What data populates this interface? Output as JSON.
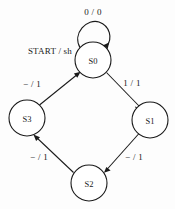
{
  "diagram": {
    "type": "state-transition-diagram",
    "background_color": "#fdfdfd",
    "line_color": "#1a1a1a",
    "start": {
      "label": "START / sh",
      "target_state": "S0"
    },
    "states": [
      {
        "id": "S0",
        "label": "S0",
        "cx": 93,
        "cy": 60,
        "r": 18
      },
      {
        "id": "S1",
        "label": "S1",
        "cx": 150,
        "cy": 120,
        "r": 18
      },
      {
        "id": "S2",
        "label": "S2",
        "cx": 89,
        "cy": 183,
        "r": 18
      },
      {
        "id": "S3",
        "label": "S3",
        "cx": 27,
        "cy": 118,
        "r": 18
      }
    ],
    "transitions": [
      {
        "id": "t-self",
        "from": "S0",
        "to": "S0",
        "label": "0 / 0",
        "label_x": 93,
        "label_y": 12
      },
      {
        "id": "t-s0-s1",
        "from": "S0",
        "to": "S1",
        "label": "1 / 1",
        "label_x": 132,
        "label_y": 83
      },
      {
        "id": "t-s1-s2",
        "from": "S1",
        "to": "S2",
        "label": "− / 1",
        "label_x": 134,
        "label_y": 157
      },
      {
        "id": "t-s2-s3",
        "from": "S2",
        "to": "S3",
        "label": "− / 1",
        "label_x": 39,
        "label_y": 157
      },
      {
        "id": "t-s3-s0",
        "from": "S3",
        "to": "S0",
        "label": "− / 1",
        "label_x": 32,
        "label_y": 84
      }
    ]
  }
}
